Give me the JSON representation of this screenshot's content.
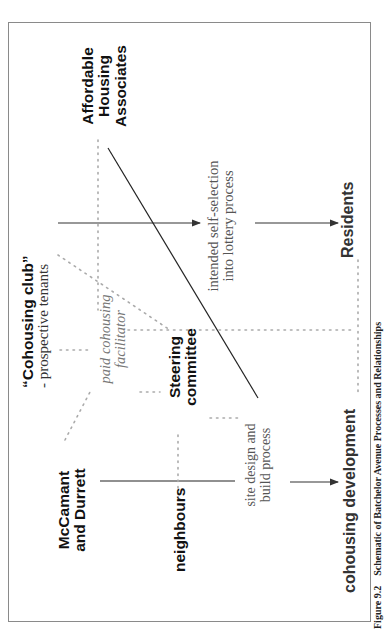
{
  "diagram": {
    "nodes": {
      "affordable_housing": {
        "lines": [
          "Affordable",
          "Housing",
          "Associates"
        ]
      },
      "cohousing_club": {
        "title": "“Cohousing club”",
        "subtitle": "- prospective tenants"
      },
      "mccamant": {
        "lines": [
          "McCamant",
          "and Durrett"
        ]
      },
      "steering": {
        "lines": [
          "Steering",
          "committee"
        ]
      },
      "neighbours": {
        "label": "neighbours"
      },
      "facilitator": {
        "lines": [
          "paid cohousing",
          "facilitator"
        ]
      },
      "self_selection": {
        "lines": [
          "intended self-selection",
          "into lottery process"
        ]
      },
      "site_design": {
        "lines": [
          "site design and",
          "build process"
        ]
      },
      "residents": {
        "label": "Residents"
      },
      "cohousing_development": {
        "label": "cohousing development"
      }
    },
    "edges": [
      {
        "from": "cohousing_club",
        "to": "self_selection",
        "style": "solid-arrow"
      },
      {
        "from": "self_selection",
        "to": "residents",
        "style": "solid-arrow"
      },
      {
        "from": "site_design",
        "to": "cohousing_development",
        "style": "solid-arrow"
      },
      {
        "from": "affordable_housing",
        "to": "site_design",
        "style": "solid"
      },
      {
        "from": "mccamant",
        "to": "site_design",
        "style": "solid"
      },
      {
        "from": "cohousing_club",
        "to": "steering",
        "style": "dotted"
      },
      {
        "from": "affordable_housing",
        "to": "facilitator",
        "style": "dotted"
      },
      {
        "from": "facilitator",
        "to": "steering",
        "style": "dotted"
      },
      {
        "from": "steering",
        "to": "residents",
        "style": "dotted"
      },
      {
        "from": "mccamant",
        "to": "steering",
        "style": "dotted"
      },
      {
        "from": "neighbours",
        "to": "cohousing_development",
        "style": "dotted"
      },
      {
        "from": "residents",
        "to": "cohousing_development",
        "style": "dotted"
      }
    ]
  },
  "caption": {
    "number": "Figure 9.2",
    "text": "Schematic of Batchelor Avenue Processes and Relationships"
  }
}
